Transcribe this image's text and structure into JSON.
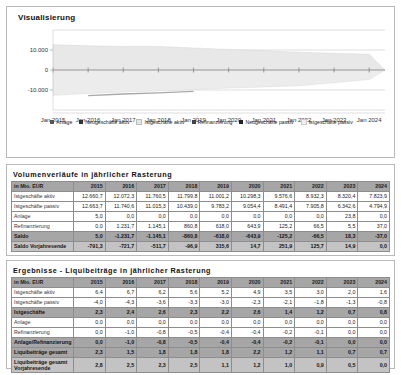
{
  "visualization": {
    "title": "Visualisierung",
    "chart_data": {
      "type": "area",
      "title": "Visualisierung",
      "xlabel": "",
      "ylabel": "",
      "grid": true,
      "legend_position": "bottom",
      "ylim": [
        -20000,
        20000
      ],
      "yticks": [
        10000,
        0,
        -10000
      ],
      "ytick_labels": [
        "10.000",
        "0",
        "-10.000"
      ],
      "x": [
        "Jan 2015",
        "Jan 2016",
        "Jan 2017",
        "Jan 2018",
        "Jan 2019",
        "Jan 2020",
        "Jan 2021",
        "Jan 2022",
        "Jan 2023",
        "Jan 2024"
      ],
      "series": [
        {
          "name": "Anlage",
          "color": "#6f6f6f",
          "values": [
            5.0,
            0.0,
            0.0,
            0.0,
            0.0,
            0.0,
            0.0,
            0.0,
            23.8,
            0.0
          ]
        },
        {
          "name": "Neugeschäfte aktiv",
          "color": "#3f3f3f",
          "values": [
            0,
            0,
            0,
            0,
            0,
            0,
            0,
            0,
            0,
            0
          ]
        },
        {
          "name": "Istgeschäfte aktiv",
          "color": "#e2e2e2",
          "values": [
            12660.7,
            12072.3,
            11760.5,
            11799.8,
            11001.2,
            10298.3,
            9576.6,
            8932.3,
            8320.4,
            7823.9
          ]
        },
        {
          "name": "Refinanzierung",
          "color": "#555555",
          "values": [
            0.0,
            1231.7,
            1145.1,
            860.8,
            618.0,
            643.9,
            125.2,
            66.5,
            5.5,
            37.0
          ]
        },
        {
          "name": "Neugeschäfte passiv",
          "color": "#2e2e2e",
          "values": [
            0,
            0,
            0,
            0,
            0,
            0,
            0,
            0,
            0,
            0
          ]
        },
        {
          "name": "Istgeschäfte passiv",
          "color": "#ededed",
          "values": [
            -12663.7,
            -11740.6,
            -11015.3,
            -10439.0,
            -9783.2,
            -9054.4,
            -8491.4,
            -7905.8,
            -6342.6,
            -4794.9
          ]
        }
      ]
    },
    "legend": [
      {
        "label": "Anlage",
        "color": "#555555"
      },
      {
        "label": "Neugeschäfte aktiv",
        "color": "#333333"
      },
      {
        "label": "Istgeschäfte aktiv",
        "color": "#e6e6e6"
      },
      {
        "label": "Refinanzierung",
        "color": "#444444"
      },
      {
        "label": "Neugeschäfte passiv",
        "color": "#222222"
      },
      {
        "label": "Istgeschäfte passiv",
        "color": "#f0f0f0"
      }
    ],
    "xticks": [
      "Jan 2015",
      "Jan 2016",
      "Jan 2017",
      "Jan 2018",
      "Jan 2019",
      "Jan 2020",
      "Jan 2021",
      "Jan 2022",
      "Jan 2023",
      "Jan 2024"
    ],
    "yticks": [
      "10.000",
      "0",
      "-10.000"
    ]
  },
  "volumen": {
    "title": "Volumenverläufe in jährlicher Rasterung",
    "unit_header": "in Mio. EUR",
    "years": [
      "2015",
      "2016",
      "2017",
      "2018",
      "2019",
      "2020",
      "2021",
      "2022",
      "2023",
      "2024"
    ],
    "rows": [
      {
        "label": "Istgeschäfte aktiv",
        "style": "plain",
        "values": [
          "12.660,7",
          "12.072,3",
          "11.760,5",
          "11.799,8",
          "11.001,2",
          "10.298,3",
          "9.576,6",
          "8.932,3",
          "8.320,4",
          "7.823,9"
        ]
      },
      {
        "label": "Istgeschäfte passiv",
        "style": "plain",
        "values": [
          "12.663,7",
          "11.740,6",
          "11.015,3",
          "10.439,0",
          "9.783,2",
          "9.054,4",
          "8.491,4",
          "7.905,8",
          "6.342,6",
          "4.794,9"
        ]
      },
      {
        "label": "Anlage",
        "style": "plain",
        "values": [
          "5,0",
          "0,0",
          "0,0",
          "0,0",
          "0,0",
          "0,0",
          "0,0",
          "0,0",
          "23,8",
          "0,0"
        ]
      },
      {
        "label": "Refinanzierung",
        "style": "plain",
        "values": [
          "0,0",
          "1.231,7",
          "1.145,1",
          "860,8",
          "618,0",
          "643,9",
          "125,2",
          "66,5",
          "5,5",
          "37,0"
        ]
      },
      {
        "label": "Saldo",
        "style": "hl",
        "values": [
          "5,0",
          "-1.231,7",
          "-1.145,1",
          "-860,8",
          "-618,0",
          "-643,9",
          "-125,2",
          "-66,5",
          "18,3",
          "-37,0"
        ]
      },
      {
        "label": "Saldo Vorjahresende",
        "style": "hl2",
        "values": [
          "-791,3",
          "-721,7",
          "-511,7",
          "-96,9",
          "315,6",
          "14,7",
          "251,9",
          "125,7",
          "14,9",
          "0,0"
        ]
      }
    ]
  },
  "ergebnisse": {
    "title": "Ergebnisse - Liquibeiträge in jährlicher Rasterung",
    "unit_header": "in Mio. EUR",
    "years": [
      "2015",
      "2016",
      "2017",
      "2018",
      "2019",
      "2020",
      "2021",
      "2022",
      "2023",
      "2024"
    ],
    "rows": [
      {
        "label": "Istgeschäfte aktiv",
        "style": "plain",
        "values": [
          "6,4",
          "6,7",
          "6,2",
          "5,6",
          "5,2",
          "4,9",
          "3,5",
          "3,0",
          "2,0",
          "1,6"
        ]
      },
      {
        "label": "Istgeschäfte passiv",
        "style": "plain",
        "values": [
          "-4,0",
          "-4,3",
          "-3,6",
          "-3,3",
          "-3,0",
          "-2,3",
          "-2,1",
          "-1,8",
          "-1,3",
          "-0,8"
        ]
      },
      {
        "label": "Istgeschäfte",
        "style": "hl",
        "values": [
          "2,3",
          "2,4",
          "2,6",
          "2,3",
          "2,2",
          "2,6",
          "1,4",
          "1,2",
          "0,7",
          "0,8"
        ]
      },
      {
        "label": "Anlage",
        "style": "plain",
        "values": [
          "0,0",
          "0,0",
          "0,0",
          "0,0",
          "0,0",
          "0,0",
          "0,0",
          "0,0",
          "0,0",
          "0,0"
        ]
      },
      {
        "label": "Refinanzierung",
        "style": "plain",
        "values": [
          "0,0",
          "-1,0",
          "-0,8",
          "-0,5",
          "-0,4",
          "-0,4",
          "-0,2",
          "-0,1",
          "0,0",
          "0,0"
        ]
      },
      {
        "label": "Anlage/Refinanzierung",
        "style": "hl",
        "values": [
          "0,0",
          "-1,0",
          "-0,8",
          "-0,5",
          "-0,4",
          "-0,4",
          "-0,2",
          "-0,1",
          "0,0",
          "0,0"
        ]
      },
      {
        "label": "Liquibeiträge gesamt",
        "style": "hl",
        "values": [
          "2,3",
          "1,5",
          "1,8",
          "1,8",
          "1,8",
          "2,2",
          "1,2",
          "1,1",
          "0,7",
          "0,7"
        ]
      },
      {
        "label": "Liquibeiträge gesamt Vorjahresende",
        "style": "hl2",
        "tall": true,
        "values": [
          "2,8",
          "2,5",
          "2,3",
          "2,5",
          "1,1",
          "1,2",
          "1,0",
          "0,9",
          "0,5",
          "0,0"
        ]
      }
    ]
  }
}
